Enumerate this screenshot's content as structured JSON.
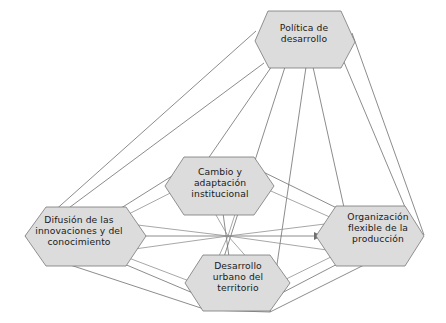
{
  "diagram": {
    "type": "network-pyramid",
    "background_color": "#ffffff",
    "node_fill_color": "#dcdcdc",
    "node_border_color": "#777777",
    "edge_color": "#6f6f6f",
    "text_color": "#1a1a1a",
    "nodes": [
      {
        "id": "politica",
        "label": "Política de\ndesarrollo",
        "role": "apex",
        "center": [
          305,
          41
        ]
      },
      {
        "id": "cambio",
        "label": "Cambio y\nadaptación\ninstitucional",
        "role": "base-back",
        "center": [
          220,
          186
        ]
      },
      {
        "id": "difusion",
        "label": "Difusión de las\ninnovaciones y del\nconocimiento",
        "role": "base-left",
        "center": [
          79,
          236
        ]
      },
      {
        "id": "organizacion",
        "label": "Organización\nflexible de la\nproducción",
        "role": "base-right",
        "center": [
          378,
          236
        ]
      },
      {
        "id": "desarrollo",
        "label": "Desarrollo\nurbano del\nterritorio",
        "role": "base-front",
        "center": [
          238,
          283
        ]
      }
    ],
    "edges": [
      {
        "from": "politica",
        "to": "difusion"
      },
      {
        "from": "politica",
        "to": "cambio"
      },
      {
        "from": "politica",
        "to": "desarrollo"
      },
      {
        "from": "politica",
        "to": "organizacion"
      },
      {
        "from": "difusion",
        "to": "cambio"
      },
      {
        "from": "cambio",
        "to": "organizacion"
      },
      {
        "from": "organizacion",
        "to": "desarrollo"
      },
      {
        "from": "desarrollo",
        "to": "difusion"
      },
      {
        "from": "difusion",
        "to": "organizacion"
      },
      {
        "from": "cambio",
        "to": "desarrollo"
      }
    ]
  }
}
